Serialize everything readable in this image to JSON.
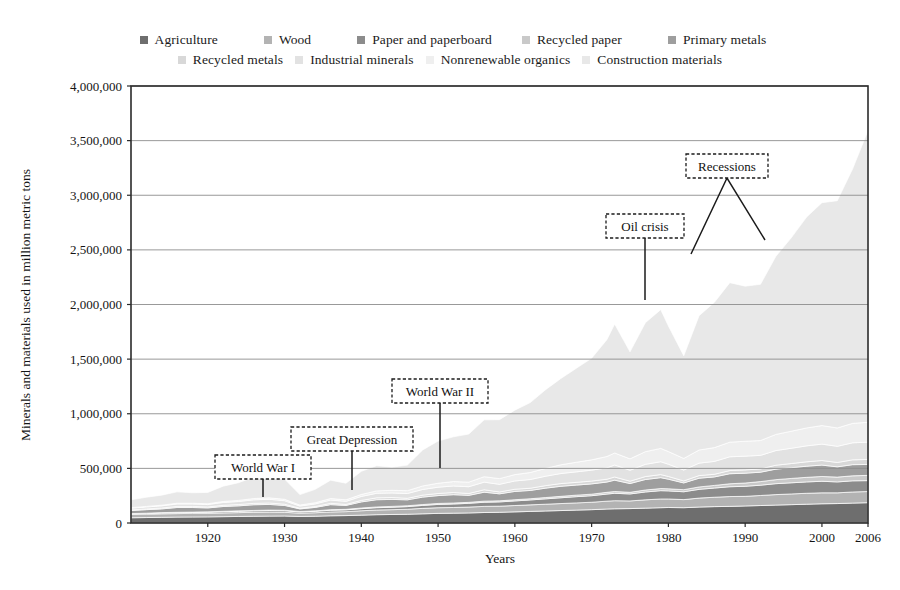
{
  "chart_data": {
    "type": "area",
    "stacked": true,
    "title": "",
    "xlabel": "Years",
    "ylabel": "Minerals and materials used in million metric tons",
    "xlim": [
      1910,
      2006
    ],
    "ylim": [
      0,
      4000000
    ],
    "grid": true,
    "legend_position": "top",
    "xticks": [
      "1920",
      "1930",
      "1940",
      "1950",
      "1960",
      "1970",
      "1980",
      "1990",
      "2000",
      "2006"
    ],
    "xtick_values": [
      1920,
      1930,
      1940,
      1950,
      1960,
      1970,
      1980,
      1990,
      2000,
      2006
    ],
    "yticks": [
      "0",
      "500,000",
      "1,000,000",
      "1,500,000",
      "2,000,000",
      "2,500,000",
      "3,000,000",
      "3,500,000",
      "4,000,000"
    ],
    "ytick_values": [
      0,
      500000,
      1000000,
      1500000,
      2000000,
      2500000,
      3000000,
      3500000,
      4000000
    ],
    "x": [
      1910,
      1912,
      1914,
      1916,
      1918,
      1920,
      1922,
      1924,
      1926,
      1928,
      1930,
      1932,
      1934,
      1936,
      1938,
      1940,
      1942,
      1944,
      1946,
      1948,
      1950,
      1952,
      1954,
      1956,
      1958,
      1960,
      1962,
      1964,
      1966,
      1968,
      1970,
      1972,
      1973,
      1975,
      1977,
      1979,
      1980,
      1982,
      1984,
      1986,
      1988,
      1990,
      1992,
      1994,
      1996,
      1998,
      2000,
      2002,
      2004,
      2006
    ],
    "series": [
      {
        "name": "Agriculture",
        "color": "#6e6e6e",
        "values": [
          48000,
          50000,
          52000,
          54000,
          55000,
          56000,
          58000,
          60000,
          62000,
          63000,
          64000,
          60000,
          62000,
          66000,
          68000,
          72000,
          76000,
          78000,
          80000,
          84000,
          88000,
          90000,
          92000,
          96000,
          98000,
          102000,
          106000,
          110000,
          114000,
          118000,
          122000,
          128000,
          130000,
          132000,
          136000,
          140000,
          142000,
          140000,
          146000,
          150000,
          152000,
          156000,
          160000,
          164000,
          168000,
          172000,
          176000,
          178000,
          182000,
          186000
        ]
      },
      {
        "name": "Wood",
        "color": "#b3b3b3",
        "values": [
          30000,
          31000,
          32000,
          32000,
          33000,
          33000,
          34000,
          35000,
          36000,
          36000,
          34000,
          30000,
          32000,
          35000,
          36000,
          40000,
          43000,
          44000,
          46000,
          50000,
          52000,
          52000,
          54000,
          56000,
          56000,
          58000,
          60000,
          62000,
          64000,
          66000,
          68000,
          72000,
          74000,
          70000,
          76000,
          80000,
          78000,
          74000,
          82000,
          86000,
          90000,
          88000,
          92000,
          96000,
          98000,
          100000,
          100000,
          98000,
          102000,
          102000
        ]
      },
      {
        "name": "Paper and paperboard",
        "color": "#8c8c8c",
        "values": [
          6000,
          7000,
          8000,
          9000,
          9000,
          10000,
          11000,
          12000,
          13000,
          14000,
          14000,
          11000,
          13000,
          16000,
          16000,
          19000,
          21000,
          22000,
          24000,
          27000,
          30000,
          32000,
          34000,
          38000,
          39000,
          42000,
          45000,
          49000,
          53000,
          57000,
          60000,
          65000,
          68000,
          64000,
          72000,
          76000,
          74000,
          72000,
          80000,
          84000,
          90000,
          92000,
          94000,
          100000,
          102000,
          104000,
          106000,
          100000,
          102000,
          100000
        ]
      },
      {
        "name": "Recycled paper",
        "color": "#c9c9c9",
        "values": [
          2000,
          2000,
          3000,
          3000,
          3000,
          3000,
          4000,
          4000,
          4000,
          5000,
          5000,
          4000,
          4000,
          5000,
          5000,
          6000,
          7000,
          8000,
          8000,
          8000,
          9000,
          9000,
          9000,
          10000,
          10000,
          11000,
          11000,
          12000,
          13000,
          14000,
          14000,
          16000,
          16000,
          15000,
          18000,
          19000,
          19000,
          19000,
          22000,
          24000,
          27000,
          30000,
          33000,
          37000,
          40000,
          42000,
          44000,
          44000,
          46000,
          48000
        ]
      },
      {
        "name": "Primary metals",
        "color": "#9e9e9e",
        "values": [
          28000,
          32000,
          34000,
          44000,
          42000,
          36000,
          44000,
          46000,
          52000,
          52000,
          44000,
          24000,
          32000,
          46000,
          36000,
          56000,
          66000,
          64000,
          54000,
          68000,
          72000,
          76000,
          64000,
          82000,
          64000,
          76000,
          76000,
          86000,
          92000,
          92000,
          94000,
          94000,
          104000,
          80000,
          96000,
          100000,
          88000,
          62000,
          80000,
          78000,
          92000,
          90000,
          86000,
          96000,
          98000,
          102000,
          104000,
          94000,
          102000,
          100000
        ]
      },
      {
        "name": "Recycled metals",
        "color": "#d8d8d8",
        "values": [
          6000,
          7000,
          8000,
          10000,
          10000,
          9000,
          11000,
          12000,
          13000,
          13000,
          11000,
          6000,
          8000,
          12000,
          9000,
          14000,
          17000,
          17000,
          14000,
          18000,
          19000,
          20000,
          17000,
          22000,
          17000,
          20000,
          20000,
          23000,
          25000,
          25000,
          26000,
          26000,
          29000,
          22000,
          27000,
          28000,
          25000,
          18000,
          24000,
          24000,
          29000,
          30000,
          30000,
          36000,
          38000,
          40000,
          42000,
          40000,
          44000,
          46000
        ]
      },
      {
        "name": "Industrial minerals",
        "color": "#e2e2e2",
        "values": [
          16000,
          18000,
          20000,
          22000,
          22000,
          22000,
          26000,
          28000,
          32000,
          34000,
          32000,
          20000,
          24000,
          30000,
          28000,
          36000,
          42000,
          42000,
          44000,
          52000,
          58000,
          60000,
          62000,
          70000,
          70000,
          76000,
          80000,
          86000,
          92000,
          96000,
          100000,
          104000,
          110000,
          100000,
          112000,
          118000,
          112000,
          100000,
          114000,
          118000,
          126000,
          126000,
          124000,
          134000,
          140000,
          146000,
          150000,
          148000,
          156000,
          158000
        ]
      },
      {
        "name": "Nonrenewable organics",
        "color": "#efefef",
        "values": [
          4000,
          5000,
          6000,
          7000,
          7000,
          7000,
          9000,
          10000,
          12000,
          13000,
          13000,
          9000,
          11000,
          14000,
          14000,
          18000,
          22000,
          24000,
          26000,
          32000,
          36000,
          40000,
          42000,
          50000,
          52000,
          58000,
          64000,
          72000,
          80000,
          88000,
          94000,
          104000,
          110000,
          104000,
          116000,
          122000,
          116000,
          106000,
          120000,
          126000,
          134000,
          136000,
          136000,
          148000,
          156000,
          164000,
          170000,
          168000,
          178000,
          182000
        ]
      },
      {
        "name": "Construction materials",
        "color": "#e8e8e8",
        "values": [
          72000,
          84000,
          92000,
          104000,
          96000,
          104000,
          140000,
          162000,
          196000,
          206000,
          186000,
          96000,
          122000,
          168000,
          152000,
          212000,
          230000,
          212000,
          234000,
          330000,
          386000,
          410000,
          440000,
          520000,
          540000,
          590000,
          640000,
          720000,
          790000,
          860000,
          930000,
          1070000,
          1180000,
          980000,
          1180000,
          1270000,
          1150000,
          940000,
          1230000,
          1330000,
          1460000,
          1420000,
          1430000,
          1630000,
          1770000,
          1930000,
          2040000,
          2080000,
          2330000,
          2670000
        ]
      }
    ],
    "annotations": [
      {
        "label": "World War I",
        "year": 1918
      },
      {
        "label": "Great Depression",
        "year": 1933
      },
      {
        "label": "World War II",
        "year": 1945
      },
      {
        "label": "Oil crisis",
        "year": 1977
      },
      {
        "label": "Recessions",
        "year": 1990
      }
    ]
  }
}
